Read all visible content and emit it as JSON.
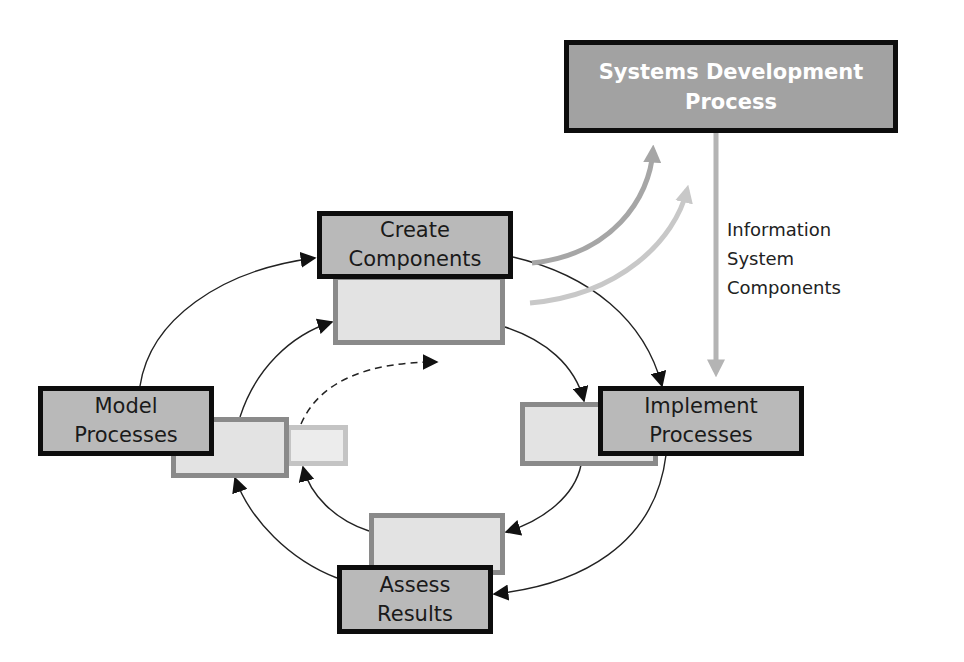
{
  "diagram": {
    "type": "process-cycle",
    "colors": {
      "primary_fill": "#a2a2a2",
      "major_fill": "#b9b9b9",
      "ghost_fill": "#e3e3e3",
      "ghost_border": "#8a8a8a",
      "faint_border": "#c4c4c4",
      "box_border": "#0d0d0d",
      "arrow_black": "#222222",
      "arrow_gray_dark": "#a6a6a6",
      "arrow_gray_light": "#c8c8c8"
    },
    "nodes": {
      "systems_development": {
        "line1": "Systems Development",
        "line2": "Process"
      },
      "create_components": {
        "line1": "Create",
        "line2": "Components"
      },
      "model_processes": {
        "line1": "Model",
        "line2": "Processes"
      },
      "implement_processes": {
        "line1": "Implement",
        "line2": "Processes"
      },
      "assess_results": {
        "line1": "Assess",
        "line2": "Results"
      }
    },
    "annotation": {
      "line1": "Information",
      "line2": "System",
      "line3": "Components"
    },
    "edges": [
      {
        "from": "Model Processes",
        "to": "Create Components",
        "style": "solid"
      },
      {
        "from": "Create Components",
        "to": "Implement Processes",
        "style": "solid"
      },
      {
        "from": "Implement Processes",
        "to": "Assess Results",
        "style": "solid"
      },
      {
        "from": "Assess Results",
        "to": "Model Processes",
        "style": "solid"
      },
      {
        "from": "Systems Development Process",
        "to": "Implement Processes",
        "style": "gray",
        "label": "Information System Components"
      },
      {
        "from": "Create Components",
        "to": "Systems Development Process",
        "style": "gray-curved"
      },
      {
        "from": "Model Processes (iteration)",
        "to": "next iteration",
        "style": "dashed"
      }
    ]
  }
}
